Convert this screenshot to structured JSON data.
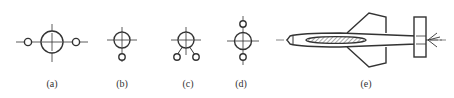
{
  "figure": {
    "stroke_color": "#333333",
    "panels": [
      {
        "id": "a",
        "label": "(a)",
        "label_x": 52
      },
      {
        "id": "b",
        "label": "(b)",
        "label_x": 122
      },
      {
        "id": "c",
        "label": "(c)",
        "label_x": 188
      },
      {
        "id": "d",
        "label": "(d)",
        "label_x": 241
      },
      {
        "id": "e",
        "label": "(e)",
        "label_x": 366
      }
    ]
  }
}
